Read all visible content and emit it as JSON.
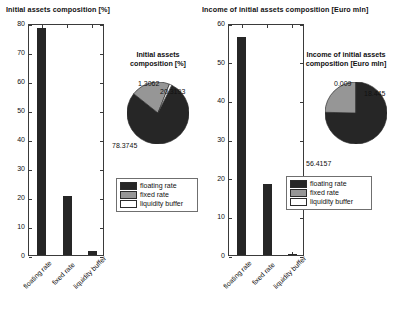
{
  "figure": {
    "background": "#ffffff",
    "colors": {
      "floating_rate": "#262626",
      "fixed_rate": "#969696",
      "liquidity_buffer": "#ffffff",
      "axis": "#3a3a3a",
      "text": "#111111"
    }
  },
  "legend": {
    "entries": [
      {
        "label": "floating rate",
        "color": "#262626"
      },
      {
        "label": "fixed rate",
        "color": "#969696"
      },
      {
        "label": "liquidity buffer",
        "color": "#ffffff"
      }
    ]
  },
  "chart_data": [
    {
      "type": "bar",
      "title": "Initial assets composition [%]",
      "xlabel": "",
      "ylabel": "",
      "categories": [
        "floating rate",
        "fixed rate",
        "liquidity buffer"
      ],
      "values": [
        78.3745,
        20.3193,
        1.3062
      ],
      "ylim": [
        0,
        80
      ],
      "yticks": [
        0,
        10,
        20,
        30,
        40,
        50,
        60,
        70,
        80
      ],
      "yticklabels": [
        "0",
        "10",
        "20",
        "30",
        "40",
        "50",
        "60",
        "70",
        "80"
      ],
      "grid": false,
      "legend_position": "none"
    },
    {
      "type": "pie",
      "title": "Initial assets composition [%]",
      "title_line1": "Initial assets",
      "title_line2": "composition [%]",
      "labels": [
        "floating rate",
        "fixed rate",
        "liquidity buffer"
      ],
      "values": [
        78.3745,
        20.3193,
        1.3062
      ],
      "datalabels": [
        "78.3745",
        "20.3193",
        "1.3062"
      ],
      "colors": [
        "#262626",
        "#969696",
        "#ffffff"
      ],
      "legend_position": "bottom"
    },
    {
      "type": "bar",
      "title": "Income of initial assets composition [Euro mln]",
      "xlabel": "",
      "ylabel": "",
      "categories": [
        "floating rate",
        "fixed rate",
        "liquidity buffer"
      ],
      "values": [
        56.4157,
        18.445,
        0.009
      ],
      "ylim": [
        0,
        60
      ],
      "yticks": [
        0,
        10,
        20,
        30,
        40,
        50,
        60
      ],
      "yticklabels": [
        "0",
        "10",
        "20",
        "30",
        "40",
        "50",
        "60"
      ],
      "grid": false,
      "legend_position": "none"
    },
    {
      "type": "pie",
      "title": "Income of initial assets composition [Euro mln]",
      "title_line1": "Income of initial assets",
      "title_line2": "composition [Euro mln]",
      "labels": [
        "floating rate",
        "fixed rate",
        "liquidity buffer"
      ],
      "values": [
        56.4157,
        18.445,
        0.009
      ],
      "datalabels": [
        "56.4157",
        "18.445",
        "0.009"
      ],
      "colors": [
        "#262626",
        "#969696",
        "#ffffff"
      ],
      "legend_position": "bottom"
    }
  ]
}
